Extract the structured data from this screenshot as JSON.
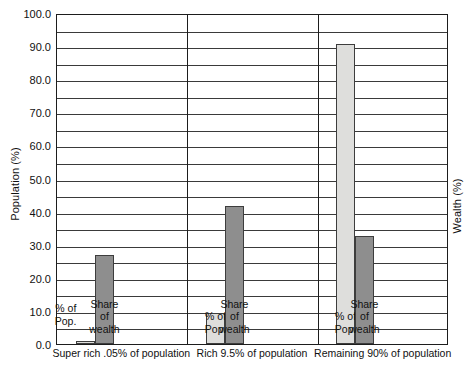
{
  "chart_data": {
    "type": "bar",
    "title": "",
    "subtitle": "",
    "ylabel": "Population (%)",
    "ylabel_secondary": "Wealth (%)",
    "xlabel": "",
    "ylim": [
      0.0,
      100.0
    ],
    "ytick_labels": [
      "0.0",
      "10.0",
      "20.0",
      "30.0",
      "40.0",
      "50.0",
      "60.0",
      "70.0",
      "80.0",
      "90.0",
      "100.0"
    ],
    "ytick_values": [
      0,
      10,
      20,
      30,
      40,
      50,
      60,
      70,
      80,
      90,
      100
    ],
    "gridlines": [
      5,
      10,
      15,
      20,
      25,
      30,
      35,
      40,
      45,
      50,
      55,
      60,
      65,
      70,
      75,
      80,
      85,
      90,
      95
    ],
    "grid": true,
    "legend": "none",
    "legend_position": "in-bar-labels",
    "categories": [
      "Super rich .05% of population",
      "Rich 9.5% of population",
      "Remaining 90% of population"
    ],
    "series": [
      {
        "name": "% of Pop.",
        "color": "#dededc",
        "values": [
          0.05,
          9.5,
          90.5
        ]
      },
      {
        "name": "Share of wealth",
        "color": "#8e8e8e",
        "values": [
          27.0,
          41.8,
          32.5
        ]
      }
    ],
    "bars": [
      {
        "group": 0,
        "series": "% of Pop.",
        "value": 0.05,
        "style": "light",
        "caption": [
          "% of",
          "Pop."
        ],
        "center_pct": 22.0,
        "width_pct": 15.0
      },
      {
        "group": 0,
        "series": "Share of wealth",
        "value": 27.0,
        "style": "dark",
        "caption": [
          "Share",
          "of",
          "wealth"
        ],
        "center_pct": 36.5,
        "width_pct": 14.0
      },
      {
        "group": 1,
        "series": "% of Pop.",
        "value": 9.5,
        "style": "light",
        "caption": [
          "% of",
          "Pop."
        ],
        "center_pct": 22.0,
        "width_pct": 15.0
      },
      {
        "group": 1,
        "series": "Share of wealth",
        "value": 41.8,
        "style": "dark",
        "caption": [
          "Share",
          "of",
          "wealth"
        ],
        "center_pct": 36.5,
        "width_pct": 14.0
      },
      {
        "group": 2,
        "series": "% of Pop.",
        "value": 90.5,
        "style": "light",
        "caption": [
          "% of",
          "Pop."
        ],
        "center_pct": 22.0,
        "width_pct": 15.0
      },
      {
        "group": 2,
        "series": "Share of wealth",
        "value": 32.5,
        "style": "dark",
        "caption": [
          "Share",
          "of",
          "wealth"
        ],
        "center_pct": 36.5,
        "width_pct": 14.0
      }
    ],
    "group_boundaries_pct": [
      33.4,
      66.9
    ],
    "colors": {
      "axis": "#1d1d1d",
      "grid": "#3a3a3a",
      "bar_light": "#dededc",
      "bar_dark": "#8e8e8e",
      "text": "#111111",
      "background": "#ffffff"
    }
  }
}
